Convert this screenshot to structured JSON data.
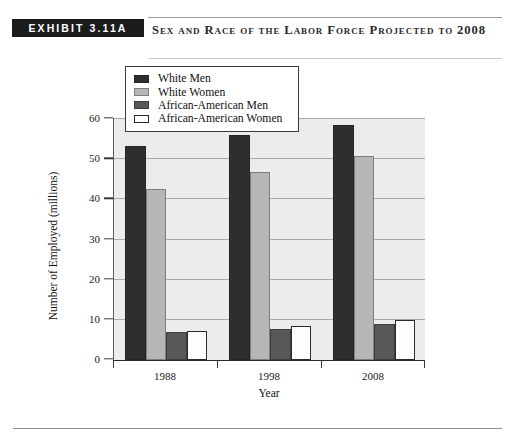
{
  "exhibit": {
    "badge": "EXHIBIT 3.11A",
    "title": "Sex and Race of the Labor Force Projected to 2008"
  },
  "chart_data": {
    "type": "bar",
    "title": "Sex and Race of the Labor Force Projected to 2008",
    "xlabel": "Year",
    "ylabel": "Number of Employed (millions)",
    "categories": [
      "1988",
      "1998",
      "2008"
    ],
    "ylim": [
      0,
      60
    ],
    "yticks": [
      0,
      10,
      20,
      30,
      40,
      50,
      60
    ],
    "grid": true,
    "legend_position": "top-left",
    "series": [
      {
        "name": "White Men",
        "color": "#2e2e2e",
        "values": [
          53.3,
          56.0,
          58.5
        ]
      },
      {
        "name": "White Women",
        "color": "#b6b6b6",
        "values": [
          42.7,
          46.8,
          50.7
        ]
      },
      {
        "name": "African-American Men",
        "color": "#585858",
        "values": [
          7.0,
          7.6,
          9.0
        ]
      },
      {
        "name": "African-American Women",
        "color": "#fdfdfd",
        "values": [
          7.1,
          8.4,
          10.0
        ]
      }
    ]
  }
}
